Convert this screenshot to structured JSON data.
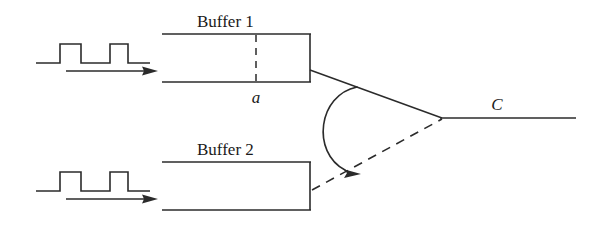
{
  "diagram": {
    "stroke_color": "#2b2b2b",
    "background_color": "#ffffff",
    "labels": {
      "buffer1": "Buffer 1",
      "buffer2": "Buffer 2",
      "marker_a": "a",
      "output_c": "C"
    },
    "buffer1": {
      "name": "Buffer 1",
      "x": 162,
      "y": 34,
      "width": 148,
      "height": 48,
      "left_edge_open": true,
      "marker_line": {
        "label": "a",
        "x": 256,
        "dashed": true
      }
    },
    "buffer2": {
      "name": "Buffer 2",
      "x": 162,
      "y": 162,
      "width": 148,
      "height": 48,
      "left_edge_open": false,
      "marker_line": null
    },
    "input_signal_top": {
      "type": "square-pulse-train",
      "pulses": 2,
      "arrow_direction": "right"
    },
    "input_signal_bottom": {
      "type": "square-pulse-train",
      "pulses": 2,
      "arrow_direction": "right"
    },
    "output_line": {
      "label": "C",
      "vertex_x": 440,
      "vertex_y": 118,
      "end_x": 576,
      "style": "solid"
    },
    "branch_top": {
      "style": "solid",
      "from": "buffer1-right-mid",
      "to": "vertex"
    },
    "branch_bottom": {
      "style": "dashed",
      "from": "buffer2-right-mid",
      "to": "vertex"
    },
    "curved_arrow": {
      "direction": "from-solid-branch-to-dashed-branch",
      "has_arrowhead": true
    }
  }
}
